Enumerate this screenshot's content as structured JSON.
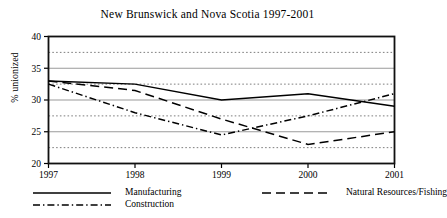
{
  "chart_data": {
    "type": "line",
    "title": "New Brunswick and Nova Scotia  1997-2001",
    "xlabel": "",
    "ylabel": "% unionized",
    "x": [
      "1997",
      "1998",
      "1999",
      "2000",
      "2001"
    ],
    "categories": [
      "1997",
      "1998",
      "1999",
      "2000",
      "2001"
    ],
    "ylim": [
      20,
      40
    ],
    "xlim": [
      1997,
      2001
    ],
    "ytick_labels": [
      "20",
      "25",
      "30",
      "35",
      "40"
    ],
    "ytick_values": [
      20,
      25,
      30,
      35,
      40
    ],
    "yminor_values": [
      22.5,
      27.5,
      32.5,
      37.5
    ],
    "grid": "horizontal major solid, horizontal minor dotted",
    "legend_position": "below-plot",
    "series": [
      {
        "name": "Manufacturing",
        "style": "solid",
        "color": "#000000",
        "values": [
          33,
          32.5,
          30,
          31,
          29
        ]
      },
      {
        "name": "Natural Resources/Fishing",
        "style": "dashed",
        "color": "#000000",
        "values": [
          33,
          31.5,
          27,
          23,
          25
        ]
      },
      {
        "name": "Construction",
        "style": "dash-dot",
        "color": "#000000",
        "values": [
          32.5,
          28,
          24.5,
          27.5,
          31
        ]
      }
    ]
  },
  "legend": {
    "items": [
      {
        "label": "Manufacturing"
      },
      {
        "label": "Natural Resources/Fishing"
      },
      {
        "label": "Construction"
      }
    ]
  }
}
